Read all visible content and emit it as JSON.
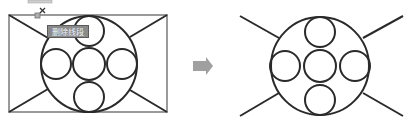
{
  "diagram": {
    "before": {
      "label": "before-trim",
      "tooltip": "删除线段",
      "stroke_color": "#2a2a2a",
      "selection_color": "#8c8c8c"
    },
    "arrow": {
      "color": "#a0a0a0",
      "direction": "right"
    },
    "after": {
      "label": "after-trim",
      "stroke_color": "#2a2a2a"
    }
  }
}
